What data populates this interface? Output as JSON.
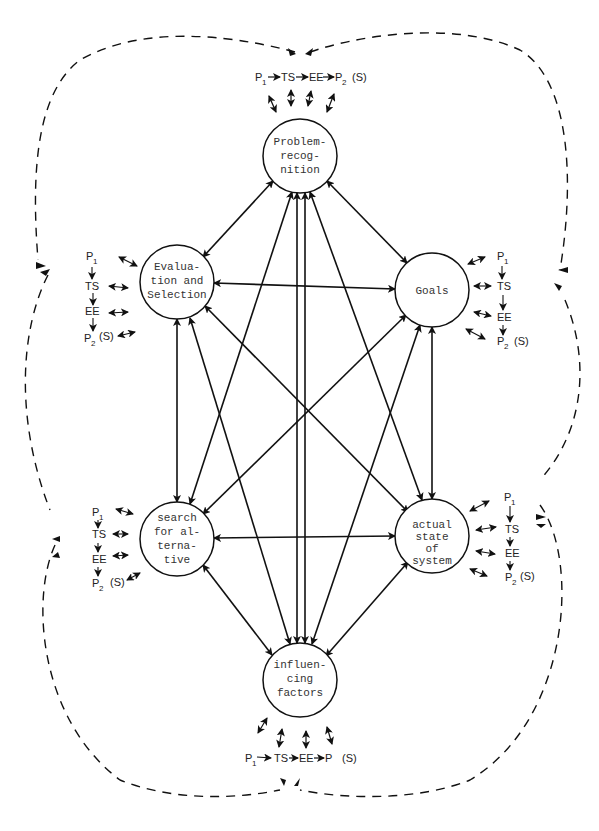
{
  "diagram": {
    "type": "network of decision-process elements",
    "nodes": [
      {
        "id": "problem",
        "lines": [
          "Problem-",
          "recog-",
          "nition"
        ],
        "cx": 300,
        "cy": 156,
        "r": 37
      },
      {
        "id": "evaluation",
        "lines": [
          "Evalua-",
          "tion and",
          "Selection"
        ],
        "cx": 177,
        "cy": 282,
        "r": 37
      },
      {
        "id": "goals",
        "lines": [
          "Goals"
        ],
        "cx": 432,
        "cy": 290,
        "r": 37
      },
      {
        "id": "search",
        "lines": [
          "search",
          "for al-",
          "terna-",
          "tive"
        ],
        "cx": 177,
        "cy": 539,
        "r": 37
      },
      {
        "id": "actual",
        "lines": [
          "actual",
          "state",
          "of",
          "system"
        ],
        "cx": 432,
        "cy": 536,
        "r": 37
      },
      {
        "id": "influencing",
        "lines": [
          "influen-",
          "cing",
          "factors"
        ],
        "cx": 300,
        "cy": 680,
        "r": 37
      }
    ],
    "subprocess": {
      "p1": "P",
      "p1_sub": "1",
      "ts": "TS",
      "ee": "EE",
      "p2": "P",
      "p2_sub": "2",
      "s": "(S)"
    },
    "top_chain": {
      "label": "P1 → TS → EE → P2 (S)"
    },
    "bottom_chain": {
      "label": "P1 → TS → EE → P (S)"
    },
    "colors": {
      "line": "#111111",
      "text": "#333333",
      "background": "#ffffff"
    }
  }
}
